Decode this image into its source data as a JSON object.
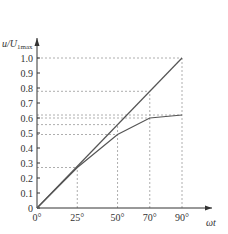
{
  "chart_data": {
    "type": "line",
    "title": "",
    "xlabel": "ωt",
    "ylabel": "u/U1max",
    "ylabel_main": "u/U",
    "ylabel_sub": "1max",
    "x_tick_labels": [
      "0°",
      "25°",
      "50°",
      "70°",
      "90°"
    ],
    "y_tick_labels": [
      "0",
      "0.1",
      "0.2",
      "0.3",
      "0.4",
      "0.5",
      "0.6",
      "0.7",
      "0.8",
      "0.9",
      "1.0"
    ],
    "xlim": [
      0,
      90
    ],
    "ylim": [
      0,
      1.0
    ],
    "grid": false,
    "reference_dashed_lines_y": [
      0.27,
      0.49,
      0.556,
      0.6,
      0.62,
      0.778,
      1.0
    ],
    "reference_dashed_lines_x": [
      25,
      50,
      70,
      90
    ],
    "series": [
      {
        "name": "linear",
        "x": [
          0,
          90
        ],
        "values": [
          0,
          1.0
        ]
      },
      {
        "name": "limited",
        "x": [
          0,
          25,
          50,
          70,
          90
        ],
        "values": [
          0,
          0.27,
          0.49,
          0.6,
          0.62
        ]
      }
    ]
  }
}
